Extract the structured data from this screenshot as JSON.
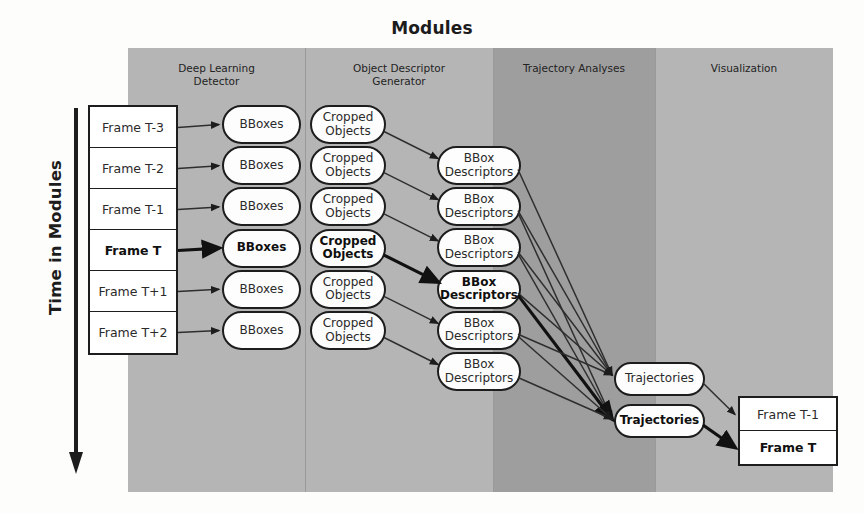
{
  "figure": {
    "title": "Modules",
    "axis_label": "Time in Modules"
  },
  "columns": [
    {
      "id": "deep-learning-detector",
      "line1": "Deep Learning",
      "line2": "Detector",
      "x": 128,
      "width": 177,
      "shade": "light"
    },
    {
      "id": "object-descriptor-generator",
      "line1": "Object Descriptor",
      "line2": "Generator",
      "x": 305,
      "width": 188,
      "shade": "light"
    },
    {
      "id": "trajectory-analyses",
      "line1": "Trajectory Analyses",
      "line2": "",
      "x": 493,
      "width": 162,
      "shade": "dark"
    },
    {
      "id": "visualization",
      "line1": "Visualization",
      "line2": "",
      "x": 655,
      "width": 178,
      "shade": "light"
    }
  ],
  "input_frames": {
    "x": 88,
    "y": 105,
    "width": 90,
    "height": 250,
    "items": [
      {
        "label": "Frame T-3",
        "emphasis": false
      },
      {
        "label": "Frame T-2",
        "emphasis": false
      },
      {
        "label": "Frame T-1",
        "emphasis": false
      },
      {
        "label": "Frame T",
        "emphasis": true
      },
      {
        "label": "Frame T+1",
        "emphasis": false
      },
      {
        "label": "Frame T+2",
        "emphasis": false
      }
    ]
  },
  "bboxes": {
    "x": 222,
    "width": 79,
    "top": 105,
    "height": 39,
    "gap": 2.2,
    "items": [
      {
        "line1": "BBoxes",
        "line2": "",
        "emphasis": false
      },
      {
        "line1": "BBoxes",
        "line2": "",
        "emphasis": false
      },
      {
        "line1": "BBoxes",
        "line2": "",
        "emphasis": false
      },
      {
        "line1": "BBoxes",
        "line2": "",
        "emphasis": true
      },
      {
        "line1": "BBoxes",
        "line2": "",
        "emphasis": false
      },
      {
        "line1": "BBoxes",
        "line2": "",
        "emphasis": false
      }
    ]
  },
  "cropped_objects": {
    "x": 310,
    "width": 76,
    "top": 105,
    "height": 39,
    "gap": 2.2,
    "items": [
      {
        "line1": "Cropped",
        "line2": "Objects",
        "emphasis": false
      },
      {
        "line1": "Cropped",
        "line2": "Objects",
        "emphasis": false
      },
      {
        "line1": "Cropped",
        "line2": "Objects",
        "emphasis": false
      },
      {
        "line1": "Cropped",
        "line2": "Objects",
        "emphasis": true
      },
      {
        "line1": "Cropped",
        "line2": "Objects",
        "emphasis": false
      },
      {
        "line1": "Cropped",
        "line2": "Objects",
        "emphasis": false
      }
    ]
  },
  "bbox_descriptors": {
    "x": 437,
    "width": 84,
    "top": 146,
    "height": 39,
    "gap": 2.2,
    "items": [
      {
        "line1": "BBox",
        "line2": "Descriptors",
        "emphasis": false
      },
      {
        "line1": "BBox",
        "line2": "Descriptors",
        "emphasis": false
      },
      {
        "line1": "BBox",
        "line2": "Descriptors",
        "emphasis": false
      },
      {
        "line1": "BBox",
        "line2": "Descriptors",
        "emphasis": true
      },
      {
        "line1": "BBox",
        "line2": "Descriptors",
        "emphasis": false
      },
      {
        "line1": "BBox",
        "line2": "Descriptors",
        "emphasis": false
      }
    ]
  },
  "trajectories": {
    "x": 614,
    "width": 91,
    "height": 34,
    "items": [
      {
        "label": "Trajectories",
        "y": 362,
        "emphasis": false
      },
      {
        "label": "Trajectories",
        "y": 404,
        "emphasis": true
      }
    ]
  },
  "output_frames": {
    "x": 738,
    "y": 396,
    "width": 100,
    "height": 70,
    "items": [
      {
        "label": "Frame T-1",
        "emphasis": false
      },
      {
        "label": "Frame T",
        "emphasis": true
      }
    ]
  },
  "colors": {
    "panel_light": "#b5b5b5",
    "panel_dark": "#9e9e9e",
    "node_fill": "#fdfdfd",
    "stroke": "#1d1d1d",
    "page_background": "#fdfdfc"
  },
  "icons": {
    "time_arrow": "down-arrow-icon"
  }
}
